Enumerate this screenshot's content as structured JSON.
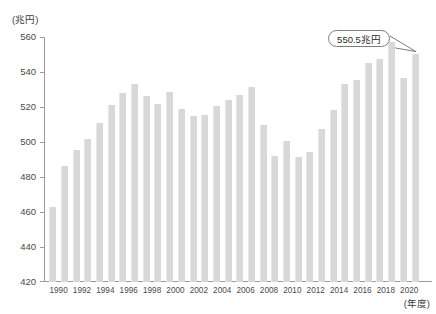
{
  "chart_data": {
    "type": "bar",
    "title": "",
    "subtitle": "",
    "xlabel": "(年度)",
    "ylabel": "(兆円)",
    "ylim": [
      420,
      560
    ],
    "y_ticks": [
      420,
      440,
      460,
      480,
      500,
      520,
      540,
      560
    ],
    "x_tick_labels": [
      "1990",
      "1992",
      "1994",
      "1996",
      "1998",
      "2000",
      "2002",
      "2004",
      "2006",
      "2008",
      "2010",
      "2012",
      "2014",
      "2016",
      "2018",
      "2020"
    ],
    "grid": false,
    "legend": "none",
    "bar_color": "#d8d8d8",
    "categories": [
      "1990",
      "1991",
      "1992",
      "1993",
      "1994",
      "1995",
      "1996",
      "1997",
      "1998",
      "1999",
      "2000",
      "2001",
      "2002",
      "2003",
      "2004",
      "2005",
      "2006",
      "2007",
      "2008",
      "2009",
      "2010",
      "2011",
      "2012",
      "2013",
      "2014",
      "2015",
      "2016",
      "2017",
      "2018",
      "2019",
      "2020",
      "2021"
    ],
    "values": [
      463.1,
      486.5,
      495.6,
      501.5,
      510.9,
      521.3,
      527.9,
      533.4,
      526.1,
      522.0,
      528.4,
      519.1,
      515.1,
      515.4,
      520.5,
      524.1,
      526.9,
      531.7,
      509.5,
      491.9,
      500.4,
      491.4,
      494.4,
      507.3,
      518.2,
      533.0,
      535.5,
      545.1,
      547.6,
      557.3,
      536.8,
      550.5
    ],
    "annotations": [
      {
        "name": "latest-value-callout",
        "text": "550.5兆円",
        "points_to_category": "2021",
        "points_to_value": 550.5
      }
    ],
    "source_note": ""
  }
}
